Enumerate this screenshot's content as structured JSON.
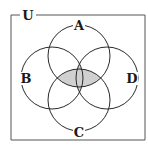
{
  "diagram": {
    "type": "venn",
    "universe_label": "U",
    "sets": [
      {
        "label": "A",
        "cx": 79,
        "cy": 56,
        "r": 31,
        "label_x": 79,
        "label_y": 30
      },
      {
        "label": "B",
        "cx": 52,
        "cy": 78,
        "r": 31,
        "label_x": 26,
        "label_y": 83
      },
      {
        "label": "C",
        "cx": 79,
        "cy": 100,
        "r": 31,
        "label_x": 79,
        "label_y": 136
      },
      {
        "label": "D",
        "cx": 107,
        "cy": 78,
        "r": 31,
        "label_x": 132,
        "label_y": 83
      }
    ],
    "shaded_region": "(A ∩ C) ∪ (B ∩ D)",
    "shade_color": "#d0d0d0",
    "stroke_color": "#2a2a2a",
    "border": {
      "x": 11,
      "y": 15,
      "width": 134,
      "height": 125
    }
  }
}
